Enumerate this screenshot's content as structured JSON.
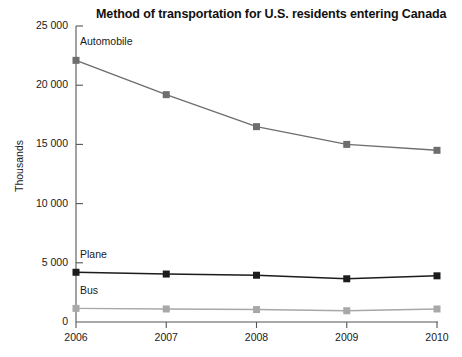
{
  "chart_data": {
    "type": "line",
    "title": "Method of transportation for U.S. residents entering Canada",
    "xlabel": "",
    "ylabel": "Thousands",
    "categories": [
      "2006",
      "2007",
      "2008",
      "2009",
      "2010"
    ],
    "x": [
      2006,
      2007,
      2008,
      2009,
      2010
    ],
    "ylim": [
      0,
      25000
    ],
    "yticks": [
      0,
      5000,
      10000,
      15000,
      20000,
      25000
    ],
    "ytick_labels": [
      "0",
      "5 000",
      "10 000",
      "15 000",
      "20 000",
      "25 000"
    ],
    "grid": false,
    "legend_position": "inline-labels",
    "marker": "square",
    "series": [
      {
        "name": "Automobile",
        "values": [
          22100,
          19200,
          16500,
          15000,
          14500
        ],
        "color": "#6e6e6e"
      },
      {
        "name": "Plane",
        "values": [
          4200,
          4050,
          3950,
          3650,
          3900
        ],
        "color": "#1c1c1c"
      },
      {
        "name": "Bus",
        "values": [
          1150,
          1100,
          1050,
          950,
          1100
        ],
        "color": "#a8a8a8"
      }
    ],
    "annotations": [
      {
        "text": "Automobile",
        "series": "Automobile"
      },
      {
        "text": "Plane",
        "series": "Plane"
      },
      {
        "text": "Bus",
        "series": "Bus"
      }
    ]
  },
  "axes": {
    "axis_color": "#555555",
    "background": "#ffffff"
  }
}
